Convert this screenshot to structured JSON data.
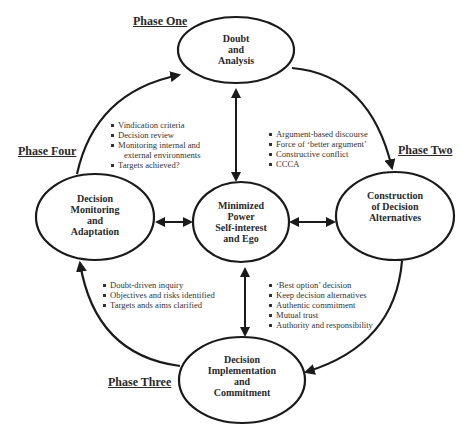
{
  "phases": {
    "one": "Phase One",
    "two": "Phase Two",
    "three": "Phase Three",
    "four": "Phase Four"
  },
  "nodes": {
    "top": {
      "lines": [
        "Doubt",
        "and",
        "Analysis"
      ]
    },
    "right": {
      "lines": [
        "Construction",
        "of Decision",
        "Alternatives"
      ]
    },
    "bottom": {
      "lines": [
        "Decision",
        "Implementation",
        "and",
        "Commitment"
      ]
    },
    "left": {
      "lines": [
        "Decision",
        "Monitoring",
        "and",
        "Adaptation"
      ]
    },
    "center": {
      "lines": [
        "Minimized",
        "Power",
        "Self-interest",
        "and Ego"
      ]
    }
  },
  "bullet_lists": {
    "phase_four": [
      "Vindication criteria",
      "Decision review",
      "Monitoring internal and",
      "external environments",
      "Targets achieved?"
    ],
    "phase_two": [
      "Argument-based discourse",
      "Force of ‘better argument’",
      "Constructive conflict",
      "CCCA"
    ],
    "phase_one": [
      "Doubt-driven inquiry",
      "Objectives and risks identified",
      "Targets ands aims clarified"
    ],
    "phase_three": [
      "‘Best option’ decision",
      "Keep decision alternatives",
      "Authentic commitment",
      "Mutual trust",
      "Authority and responsibility"
    ]
  },
  "colors": {
    "stroke": "#1a1a1a",
    "text": "#2a2a2a",
    "background": "#ffffff"
  }
}
